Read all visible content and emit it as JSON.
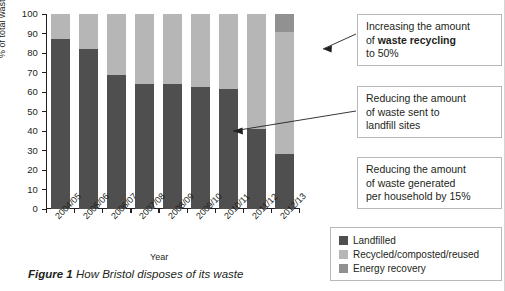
{
  "figure": {
    "caption_number": "Figure 1",
    "caption_text": "How Bristol disposes of its waste"
  },
  "chart_data": {
    "type": "bar",
    "stacked": true,
    "title": "",
    "xlabel": "Year",
    "ylabel": "% of total waste",
    "ylim": [
      0,
      100
    ],
    "ytick_step": 10,
    "grid": false,
    "legend_position": "bottom-right",
    "categories": [
      "2004/05",
      "2005/06",
      "2006/07",
      "2007/08",
      "2008/09",
      "2009/10",
      "2010/11",
      "2011/12",
      "2012/13"
    ],
    "yticks": [
      "0",
      "10",
      "20",
      "30",
      "40",
      "50",
      "60",
      "70",
      "80",
      "90",
      "100"
    ],
    "series": [
      {
        "name": "Landfilled",
        "color": "#4f4f4f",
        "values": [
          87,
          82,
          68.5,
          64,
          64,
          62.5,
          61.5,
          41,
          28
        ]
      },
      {
        "name": "Recycled/composted/reused",
        "color": "#b6b6b6",
        "values": [
          13,
          18,
          31.5,
          36,
          36,
          37.5,
          38.5,
          59,
          63
        ]
      },
      {
        "name": "Energy recovery",
        "color": "#919191",
        "values": [
          0,
          0,
          0,
          0,
          0,
          0,
          0,
          0,
          9
        ]
      }
    ]
  },
  "legend": {
    "items": [
      {
        "label": "Landfilled",
        "color": "#4f4f4f"
      },
      {
        "label": "Recycled/composted/reused",
        "color": "#b6b6b6"
      },
      {
        "label": "Energy recovery",
        "color": "#919191"
      }
    ]
  },
  "callouts": [
    {
      "id": "recycling",
      "line1": "Increasing the amount",
      "line2_prefix": "of ",
      "line2_bold": "waste recycling",
      "line3": "to 50%"
    },
    {
      "id": "landfill",
      "line1": "Reducing the amount",
      "line2": "of waste sent to",
      "line3": "landfill sites"
    },
    {
      "id": "household",
      "line1": "Reducing the amount",
      "line2": "of waste generated",
      "line3": "per household by 15%"
    }
  ],
  "colors": {
    "landfilled": "#4f4f4f",
    "recycled": "#b6b6b6",
    "energy": "#919191",
    "axis": "#231f20",
    "box_border": "#b9b9b9"
  }
}
